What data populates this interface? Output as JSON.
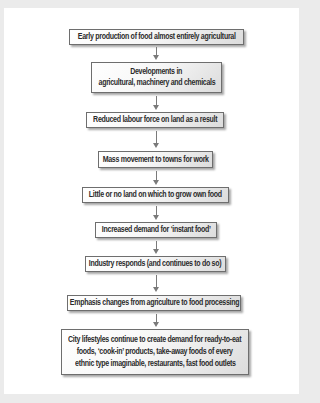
{
  "flowchart": {
    "steps": [
      {
        "lines": [
          "Early production of food almost entirely agricultural"
        ]
      },
      {
        "lines": [
          "Developments in",
          "agricultural, machinery and chemicals"
        ]
      },
      {
        "lines": [
          "Reduced labour force on land as a result"
        ]
      },
      {
        "lines": [
          "Mass movement to towns for work"
        ]
      },
      {
        "lines": [
          "Little or no land on which to grow own food"
        ]
      },
      {
        "lines": [
          "Increased demand for ‘instant food’"
        ]
      },
      {
        "lines": [
          "Industry responds (and continues to do so)"
        ]
      },
      {
        "lines": [
          "Emphasis changes from agriculture to food processing"
        ]
      },
      {
        "lines": [
          "City lifestyles continue to create demand for ready-to-eat",
          "foods, ‘cook-in’ products, take-away foods of every",
          "ethnic type imaginable, restaurants, fast food outlets"
        ]
      }
    ]
  },
  "colors": {
    "frame": "#ebebeb",
    "panel": "#ffffff",
    "box_border": "#6e6e6e",
    "text": "#2b2b2b",
    "arrow": "#7a7a7a"
  }
}
